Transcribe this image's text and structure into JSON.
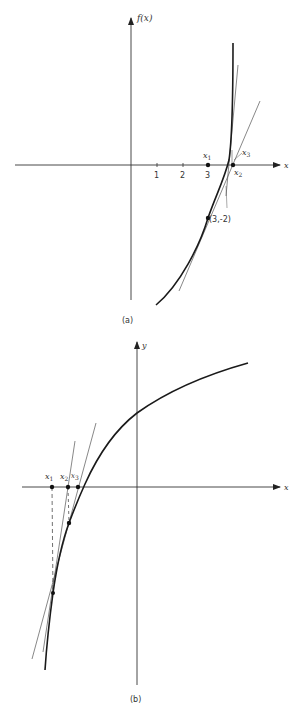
{
  "figure_a": {
    "caption": "(a)",
    "y_axis_label": "f(x)",
    "x_axis_label": "x",
    "ticks": [
      "1",
      "2",
      "3"
    ],
    "points": {
      "x1": {
        "label": "x",
        "sub": "1"
      },
      "x2": {
        "label": "x",
        "sub": "2"
      },
      "x3": {
        "label": "x",
        "sub": "3"
      }
    },
    "annotation": "(3,-2)"
  },
  "figure_b": {
    "caption": "(b)",
    "y_axis_label": "y",
    "x_axis_label": "x",
    "points": {
      "x1": {
        "label": "x",
        "sub": "1"
      },
      "x2": {
        "label": "x",
        "sub": "2"
      },
      "x3": {
        "label": "x",
        "sub": "3"
      }
    }
  },
  "colors": {
    "ink": "#222222",
    "thin_line": "#555555",
    "background": "#ffffff"
  }
}
